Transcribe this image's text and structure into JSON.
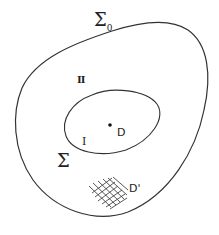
{
  "diagram": {
    "outer_boundary": {
      "label": "Σ",
      "label_subscript": "0",
      "region_label": "II"
    },
    "inner_boundary": {
      "label": "Σ",
      "region_label": "I"
    },
    "point": {
      "label": "D"
    },
    "patch": {
      "label": "D'"
    },
    "colors": {
      "stroke": "#333333",
      "text": "#222222",
      "background": "#ffffff"
    }
  }
}
